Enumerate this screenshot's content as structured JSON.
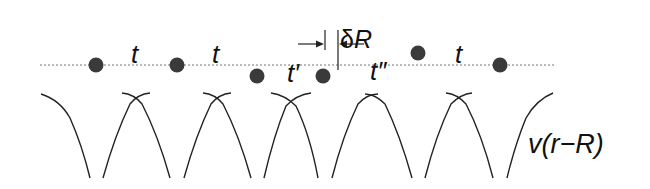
{
  "diagram": {
    "colors": {
      "atom": "#3a3a3a",
      "line": "#222222",
      "dotted_line": "#777777",
      "text": "#111111",
      "background": "#ffffff"
    },
    "chain_line": {
      "x1": 40,
      "x2": 556,
      "y": 65,
      "style": "dotted"
    },
    "atoms": [
      {
        "id": "atom-1",
        "cx": 96,
        "cy": 65
      },
      {
        "id": "atom-2",
        "cx": 177,
        "cy": 65
      },
      {
        "id": "atom-3",
        "cx": 257,
        "cy": 76
      },
      {
        "id": "atom-4",
        "cx": 323,
        "cy": 76
      },
      {
        "id": "atom-5",
        "cx": 418,
        "cy": 53
      },
      {
        "id": "atom-6",
        "cx": 500,
        "cy": 65
      }
    ],
    "hopping_labels": [
      {
        "text": "t",
        "x": 131,
        "y": 63
      },
      {
        "text": "t",
        "x": 212,
        "y": 63
      },
      {
        "text": "t′",
        "x": 287,
        "y": 82
      },
      {
        "text": "t″",
        "x": 370,
        "y": 80
      },
      {
        "text": "t",
        "x": 455,
        "y": 63
      }
    ],
    "displacement": {
      "label": "δR",
      "left_line_x": 325,
      "right_line_x": 338,
      "label_x": 340,
      "label_y": 48
    },
    "potential_label": "v(r−R)",
    "potential": {
      "crossings_x": [
        136,
        217,
        291,
        372,
        459
      ],
      "top_y": 93,
      "bottom_y": 178
    }
  }
}
